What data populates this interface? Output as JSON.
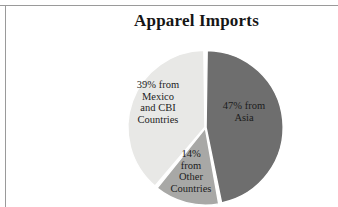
{
  "figure": {
    "title": "Apparel Imports",
    "background_color": "#ffffff",
    "border_color": "#9a9a9a",
    "text_color": "#1c1c1c"
  },
  "chart_data": {
    "type": "pie",
    "title": "Apparel Imports",
    "xlabel": "",
    "ylabel": "",
    "units": "percent",
    "legend": "none",
    "grid": false,
    "labels_inside_slices": true,
    "categories": [
      "Asia",
      "Mexico and CBI Countries",
      "Other Countries"
    ],
    "values": [
      47,
      39,
      14
    ],
    "colors": [
      "#6e6e6e",
      "#e8e8e6",
      "#a8a8a6"
    ],
    "slices": [
      {
        "name": "Asia",
        "value": 47,
        "color": "#6e6e6e",
        "label_lines": [
          "47% from",
          "Asia"
        ]
      },
      {
        "name": "Mexico and CBI Countries",
        "value": 39,
        "color": "#e8e8e6",
        "label_lines": [
          "39%  from",
          "Mexico",
          "and CBI",
          "Countries"
        ]
      },
      {
        "name": "Other Countries",
        "value": 14,
        "color": "#a8a8a6",
        "label_lines": [
          "14%",
          "from",
          "Other",
          "Countries"
        ]
      }
    ]
  }
}
